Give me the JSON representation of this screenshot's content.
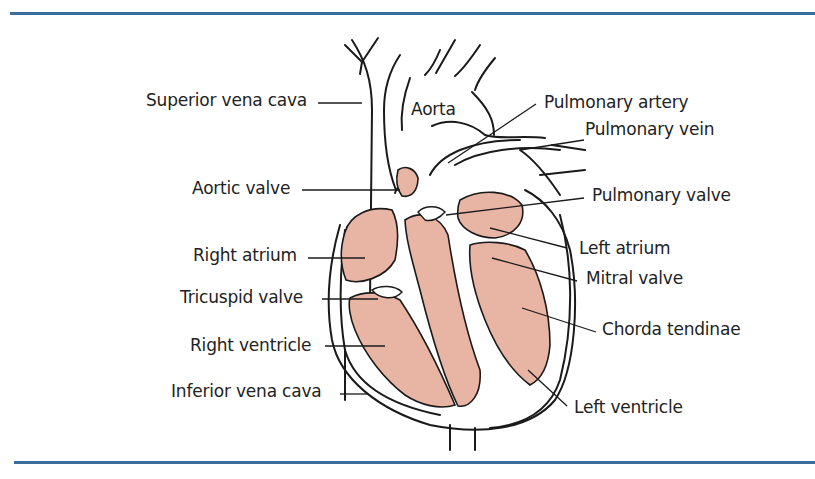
{
  "figure": {
    "accent_color": "#3a6e9e",
    "muscle_color": "#e8b4a4",
    "labels_left": [
      {
        "id": "superior-vena-cava",
        "text": "Superior vena cava"
      },
      {
        "id": "aortic-valve",
        "text": "Aortic valve"
      },
      {
        "id": "right-atrium",
        "text": "Right atrium"
      },
      {
        "id": "tricuspid-valve",
        "text": "Tricuspid valve"
      },
      {
        "id": "right-ventricle",
        "text": "Right ventricle"
      },
      {
        "id": "inferior-vena-cava",
        "text": "Inferior vena cava"
      }
    ],
    "labels_center": [
      {
        "id": "aorta",
        "text": "Aorta"
      }
    ],
    "labels_right": [
      {
        "id": "pulmonary-artery",
        "text": "Pulmonary artery"
      },
      {
        "id": "pulmonary-vein",
        "text": "Pulmonary vein"
      },
      {
        "id": "pulmonary-valve",
        "text": "Pulmonary valve"
      },
      {
        "id": "left-atrium",
        "text": "Left atrium"
      },
      {
        "id": "mitral-valve",
        "text": "Mitral valve"
      },
      {
        "id": "chorda-tendinae",
        "text": "Chorda tendinae"
      },
      {
        "id": "left-ventricle",
        "text": "Left ventricle"
      }
    ]
  }
}
